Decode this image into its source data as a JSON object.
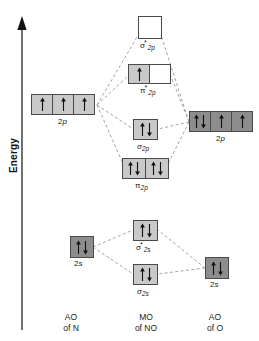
{
  "axis": {
    "energy_label": "Energy",
    "direction": "up"
  },
  "columns": [
    {
      "id": "ao-n",
      "line1": "AO",
      "line2": "of N"
    },
    {
      "id": "mo-no",
      "line1": "MO",
      "line2": "of NO"
    },
    {
      "id": "ao-o",
      "line1": "AO",
      "line2": "of O"
    }
  ],
  "colors": {
    "n_orbital_fill": "#c9c9c9",
    "o_orbital_fill": "#8d8d8d",
    "mo_fill": "#c9c9c9",
    "empty_fill": "#ffffff",
    "box_border": "#4a4a4a",
    "wire": "#8a8a8a",
    "text": "#1a1a1a"
  },
  "orbitals": {
    "n_2p": {
      "label_text": "2p",
      "label_italic": "p",
      "label_prefix": "2",
      "fill": "n_orbital_fill",
      "boxes": 3,
      "electrons": [
        "up",
        "up",
        "up"
      ]
    },
    "n_2s": {
      "label_text": "2s",
      "label_prefix": "2",
      "label_italic": "s",
      "fill": "o_orbital_fill",
      "boxes": 1,
      "electrons": [
        "updown"
      ]
    },
    "o_2p": {
      "label_text": "2p",
      "label_prefix": "2",
      "label_italic": "p",
      "fill": "o_orbital_fill",
      "boxes": 3,
      "electrons": [
        "updown",
        "up",
        "up"
      ]
    },
    "o_2s": {
      "label_text": "2s",
      "label_prefix": "2",
      "label_italic": "s",
      "fill": "o_orbital_fill",
      "boxes": 1,
      "electrons": [
        "updown"
      ]
    },
    "sigma_star_2p": {
      "symbol": "σ",
      "star": "*",
      "sub": "2p",
      "fill": "empty_fill",
      "boxes": 1,
      "electrons": [
        "none"
      ]
    },
    "pi_star_2p": {
      "symbol": "π",
      "star": "*",
      "sub": "2p",
      "boxes": 2,
      "electrons": [
        "up",
        "none"
      ]
    },
    "sigma_2p": {
      "symbol": "σ",
      "star": "",
      "sub": "2p",
      "fill": "mo_fill",
      "boxes": 1,
      "electrons": [
        "updown"
      ]
    },
    "pi_2p": {
      "symbol": "π",
      "star": "",
      "sub": "2p",
      "fill": "mo_fill",
      "boxes": 2,
      "electrons": [
        "updown",
        "updown"
      ]
    },
    "sigma_star_2s": {
      "symbol": "σ",
      "star": "*",
      "sub": "2s",
      "fill": "mo_fill",
      "boxes": 1,
      "electrons": [
        "updown"
      ]
    },
    "sigma_2s": {
      "symbol": "σ",
      "star": "",
      "sub": "2s",
      "fill": "mo_fill",
      "boxes": 1,
      "electrons": [
        "updown"
      ]
    }
  }
}
